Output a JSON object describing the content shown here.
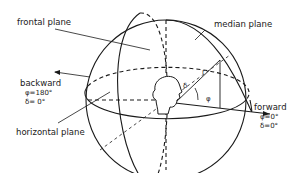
{
  "labels": {
    "frontal_plane": "frontal plane",
    "median_plane": "median plane",
    "horizontal_plane": "horizontal plane",
    "backward": {
      "title": "backward",
      "phi": "φ=180°",
      "delta": "δ=  0°"
    },
    "forward": {
      "title": "forward",
      "phi": "φ=0°",
      "delta": "δ=0°"
    },
    "symbols": {
      "r": "r",
      "delta": "δ",
      "phi": "φ"
    }
  },
  "colors": {
    "stroke": "#1a1a1a",
    "background": "#ffffff"
  }
}
